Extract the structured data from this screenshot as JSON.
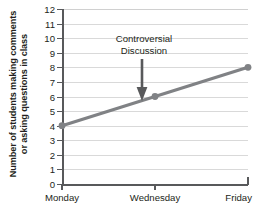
{
  "chart_data": {
    "type": "line",
    "title": "",
    "xlabel": "",
    "ylabel_lines": [
      "Number of students making comments",
      "or asking questions in class"
    ],
    "categories": [
      "Monday",
      "Wednesday",
      "Friday"
    ],
    "values": [
      4,
      6,
      8
    ],
    "series": [
      {
        "name": "students participating",
        "values": [
          4,
          6,
          8
        ]
      }
    ],
    "ylim": [
      0,
      12
    ],
    "ytick_labels": [
      "0",
      "1",
      "2",
      "3",
      "4",
      "5",
      "6",
      "7",
      "8",
      "9",
      "10",
      "11",
      "12"
    ],
    "ytick_values": [
      0,
      1,
      2,
      3,
      4,
      5,
      6,
      7,
      8,
      9,
      10,
      11,
      12
    ],
    "gridline_values": [
      1,
      2,
      3,
      4,
      5,
      6,
      7,
      8,
      9,
      10,
      11,
      12
    ],
    "grid": true,
    "legend": "none",
    "annotations": [
      {
        "text_lines": [
          "Controversial",
          "Discussion"
        ],
        "points_to_category": "Wednesday",
        "points_to_value": 6
      }
    ],
    "colors": {
      "line": "#808285",
      "marker": "#808285",
      "grid": "#d9d9d9",
      "axis": "#58595b",
      "text": "#231f20",
      "arrow": "#58595b",
      "background": "#ffffff"
    }
  }
}
